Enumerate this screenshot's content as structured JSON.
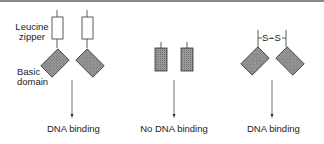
{
  "labels": {
    "leucine_zipper_line1": "Leucine",
    "leucine_zipper_line2": "zipper",
    "basic_domain_line1": "Basic",
    "basic_domain_line2": "domain",
    "disulfide": "S–S"
  },
  "panels": [
    {
      "id": "wild-type",
      "result": "DNA binding"
    },
    {
      "id": "no-zipper",
      "result": "No DNA binding"
    },
    {
      "id": "disulfide-linked",
      "result": "DNA binding"
    }
  ],
  "colors": {
    "stroke": "#333333",
    "hatch_fill": "#8c8c8c",
    "zipper_fill": "#ffffff"
  }
}
